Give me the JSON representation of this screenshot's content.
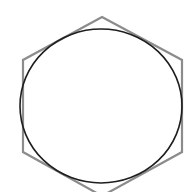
{
  "diagram": {
    "background": "#ffffff",
    "hexagon": {
      "points": "102,17 182,60 182,152 102,196 23,152 23,60",
      "stroke": "#8c8c8c",
      "stroke_width": "2.2"
    },
    "circle": {
      "cx": "101",
      "cy": "106",
      "rx": "81",
      "ry": "77",
      "stroke": "#1e1e1e",
      "stroke_width": "1.6"
    }
  }
}
